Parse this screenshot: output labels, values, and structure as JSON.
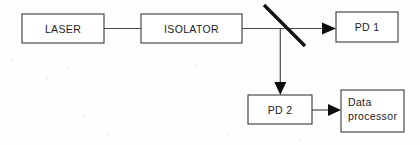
{
  "diagram": {
    "background_color": "#fefefe",
    "line_color": "#4a4a4a",
    "box_stroke_color": "#3a3a3a",
    "box_fill_color": "#ffffff",
    "text_color": "#1c1c1c",
    "splitter_color": "#121212",
    "arrow_color": "#0d0d0d",
    "width": 420,
    "height": 145
  },
  "nodes": {
    "laser": {
      "label": "LASER",
      "x": 22,
      "y": 14,
      "width": 82,
      "height": 29,
      "text_align": "center"
    },
    "isolator": {
      "label": "ISOLATOR",
      "x": 141,
      "y": 14,
      "width": 101,
      "height": 29,
      "text_align": "center"
    },
    "pd1": {
      "label": "PD 1",
      "x": 336,
      "y": 12,
      "width": 62,
      "height": 30,
      "text_align": "center"
    },
    "pd2": {
      "label": "PD 2",
      "x": 248,
      "y": 95,
      "width": 64,
      "height": 29,
      "text_align": "center"
    },
    "data_processor": {
      "label_line1": "Data",
      "label_line2": "processor",
      "x": 341,
      "y": 90,
      "width": 63,
      "height": 42,
      "text_align": "left"
    }
  },
  "connections": {
    "laser_to_isolator": {
      "name": "beam-laser-to-isolator",
      "from": "laser",
      "to": "isolator",
      "has_arrow": false
    },
    "isolator_to_splitter": {
      "name": "beam-isolator-to-splitter",
      "from": "isolator",
      "to": "beam-splitter",
      "has_arrow": false
    },
    "splitter_to_pd1": {
      "name": "beam-splitter-to-pd1",
      "from": "beam-splitter",
      "to": "pd1",
      "has_arrow": true,
      "direction": "right"
    },
    "splitter_to_pd2": {
      "name": "beam-splitter-to-pd2",
      "from": "beam-splitter",
      "to": "pd2",
      "has_arrow": true,
      "direction": "down"
    },
    "pd2_to_processor": {
      "name": "signal-pd2-to-data-processor",
      "from": "pd2",
      "to": "data_processor",
      "has_arrow": true,
      "direction": "right"
    }
  },
  "beam_splitter": {
    "name": "beam-splitter",
    "x1": 264,
    "y1": 5,
    "x2": 305,
    "y2": 46
  }
}
